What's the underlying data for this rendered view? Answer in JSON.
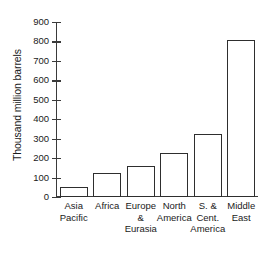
{
  "chart_data": {
    "type": "bar",
    "title": "",
    "xlabel": "",
    "ylabel": "Thousand million barrels",
    "categories": [
      "Asia\nPacific",
      "Africa",
      "Europe\n&\nEurasia",
      "North\nAmerica",
      "S. &\nCent.\nAmerica",
      "Middle\nEast"
    ],
    "values": [
      50,
      125,
      160,
      225,
      325,
      810
    ],
    "ylim": [
      0,
      900
    ],
    "y_ticks": [
      0,
      100,
      200,
      300,
      400,
      500,
      600,
      700,
      800,
      900
    ],
    "y_tick_labels": [
      "0",
      "100",
      "200",
      "300",
      "400",
      "500",
      "600",
      "700",
      "800",
      "900"
    ],
    "grid": false,
    "legend": false,
    "bar_fill_color": "#ffffff",
    "bar_edge_color": "#2e2e2e",
    "axis_color": "#3a3a3a",
    "background_color": "#ffffff"
  }
}
